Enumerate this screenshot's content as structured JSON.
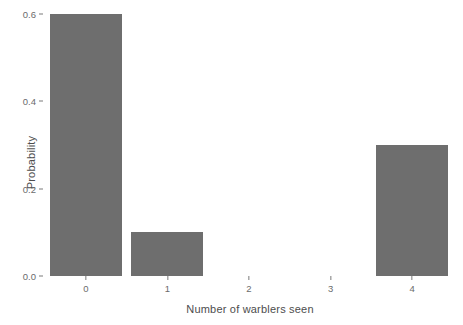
{
  "chart_data": {
    "type": "bar",
    "title": "",
    "subtitle": "",
    "xlabel": "Number of warblers seen",
    "ylabel": "Probability",
    "categories": [
      "0",
      "1",
      "2",
      "3",
      "4"
    ],
    "values": [
      0.6,
      0.1,
      0.0,
      0.0,
      0.3
    ],
    "series": [
      {
        "name": "Probability",
        "values": [
          0.6,
          0.1,
          0.0,
          0.0,
          0.3
        ]
      }
    ],
    "xlim": [
      -0.5,
      4.5
    ],
    "ylim": [
      0.0,
      0.6
    ],
    "ytick_labels": [
      "0.0",
      "0.2",
      "0.4",
      "0.6"
    ],
    "ytick_values": [
      0.0,
      0.2,
      0.4,
      0.6
    ],
    "xtick_labels": [
      "0",
      "1",
      "2",
      "3",
      "4"
    ],
    "xtick_values": [
      0,
      1,
      2,
      3,
      4
    ],
    "grid": false,
    "legend": false,
    "legend_position": "none",
    "bar_color": "#6e6e6e",
    "panel_background": "#ffffff",
    "axis_text_color": "#6b6b6b",
    "axis_title_color": "#4d4d4d",
    "tick_color": "#7a7a7a"
  }
}
